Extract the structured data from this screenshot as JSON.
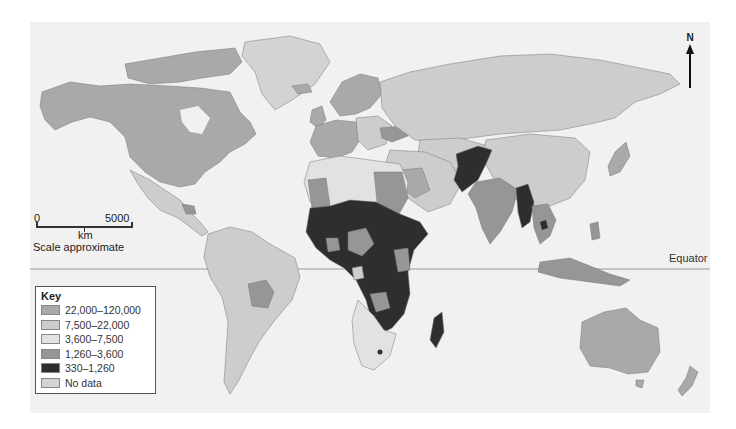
{
  "map": {
    "background": "#f1f1f1",
    "ocean_color": "#f1f1f1",
    "equator_label": "Equator",
    "north_label": "N"
  },
  "scale": {
    "start": "0",
    "end": "5000",
    "unit": "km",
    "note": "Scale approximate"
  },
  "key": {
    "title": "Key",
    "items": [
      {
        "label": "22,000–120,000",
        "color": "#a9a9a9"
      },
      {
        "label": "7,500–22,000",
        "color": "#cdcdcd"
      },
      {
        "label": "3,600–7,500",
        "color": "#e2e2e2"
      },
      {
        "label": "1,260–3,600",
        "color": "#969696"
      },
      {
        "label": "330–1,260",
        "color": "#2e2e2e"
      },
      {
        "label": "No data",
        "color": "#d3d3d3"
      }
    ]
  },
  "regions": [
    {
      "name": "North America (USA, Canada)",
      "class": "22,000–120,000"
    },
    {
      "name": "Greenland",
      "class": "No data"
    },
    {
      "name": "Mexico / Central America",
      "class": "7,500–22,000"
    },
    {
      "name": "South America",
      "class": "7,500–22,000"
    },
    {
      "name": "Bolivia",
      "class": "1,260–3,600"
    },
    {
      "name": "Western Europe",
      "class": "22,000–120,000"
    },
    {
      "name": "Eastern Europe / Russia",
      "class": "7,500–22,000"
    },
    {
      "name": "Ukraine",
      "class": "1,260–3,600"
    },
    {
      "name": "North Africa",
      "class": "3,600–7,500"
    },
    {
      "name": "Sub-Saharan Africa",
      "class": "330–1,260"
    },
    {
      "name": "Afghanistan / Pakistan",
      "class": "330–1,260"
    },
    {
      "name": "India",
      "class": "1,260–3,600"
    },
    {
      "name": "Myanmar",
      "class": "330–1,260"
    },
    {
      "name": "China",
      "class": "7,500–22,000"
    },
    {
      "name": "Japan",
      "class": "22,000–120,000"
    },
    {
      "name": "Australia / New Zealand",
      "class": "22,000–120,000"
    },
    {
      "name": "Madagascar",
      "class": "330–1,260"
    }
  ]
}
